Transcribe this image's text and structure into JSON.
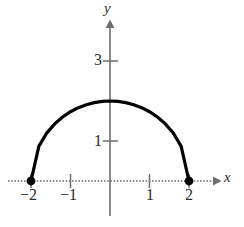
{
  "figure": {
    "kind": "semicircle-graph",
    "background_color": "#ffffff",
    "curve_color": "#000000",
    "axis_color": "#6e6e6e",
    "text_color": "#2b2b2b"
  },
  "axes": {
    "x": {
      "label": "x",
      "label_name": "x-axis-label",
      "tick_values": [
        -2,
        -1,
        1,
        2
      ],
      "tick_labels": [
        "−2",
        "−1",
        "1",
        "2"
      ],
      "arrow": "right",
      "style": "dotted"
    },
    "y": {
      "label": "y",
      "label_name": "y-axis-label",
      "tick_values": [
        1,
        3
      ],
      "tick_labels": [
        "1",
        "3"
      ],
      "arrow": "up",
      "style": "solid"
    },
    "origin_px": {
      "x": 110,
      "y": 181
    },
    "unit_px": {
      "x": 39.5,
      "y": 40
    }
  },
  "chart_data": {
    "type": "line",
    "title": "",
    "xlabel": "x",
    "ylabel": "y",
    "xlim": [
      -2.9,
      3.0
    ],
    "ylim": [
      -1.1,
      4.5
    ],
    "xticks": [
      -2,
      -1,
      1,
      2
    ],
    "xticklabels": [
      "−2",
      "−1",
      "1",
      "2"
    ],
    "yticks": [
      1,
      3
    ],
    "yticklabels": [
      "1",
      "3"
    ],
    "grid": false,
    "legend": null,
    "series": [
      {
        "name": "upper semicircle radius 2",
        "equation": "y = sqrt(4 - x^2)",
        "domain": [
          -2,
          2
        ],
        "color": "#000000",
        "linewidth": 3,
        "x": [
          -2.0,
          -1.8,
          -1.6,
          -1.4,
          -1.2,
          -1.0,
          -0.8,
          -0.6,
          -0.4,
          -0.2,
          0.0,
          0.2,
          0.4,
          0.6,
          0.8,
          1.0,
          1.2,
          1.4,
          1.6,
          1.8,
          2.0
        ],
        "values": [
          0.0,
          0.872,
          1.2,
          1.428,
          1.6,
          1.732,
          1.833,
          1.908,
          1.959,
          1.99,
          2.0,
          1.99,
          1.959,
          1.908,
          1.833,
          1.732,
          1.6,
          1.428,
          1.2,
          0.872,
          0.0
        ]
      }
    ],
    "points": [
      {
        "name": "left-endpoint",
        "x": -2,
        "y": 0,
        "marker": "filled-circle",
        "color": "#000000"
      },
      {
        "name": "right-endpoint",
        "x": 2,
        "y": 0,
        "marker": "filled-circle",
        "color": "#000000"
      }
    ],
    "annotations": []
  }
}
